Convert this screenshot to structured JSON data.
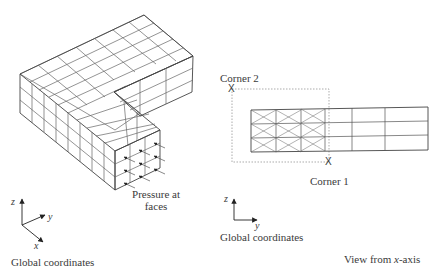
{
  "figure": {
    "left_panel": {
      "title": "Isometric L-shaped meshed solid",
      "annotation": {
        "line1": "Pressure at",
        "line2": "faces"
      },
      "axes": {
        "x": "x",
        "y": "y",
        "z": "z",
        "caption": "Global coordinates"
      }
    },
    "right_panel": {
      "corner1": "Corner 1",
      "corner2": "Corner 2",
      "corner_marker": "X",
      "axes": {
        "y": "y",
        "z": "z",
        "caption": "Global coordinates"
      },
      "view_caption_prefix": "View from ",
      "view_caption_axis": "x",
      "view_caption_suffix": "-axis"
    },
    "colors": {
      "line": "#555555",
      "dash": "#777777",
      "text": "#3a3a3a"
    }
  }
}
